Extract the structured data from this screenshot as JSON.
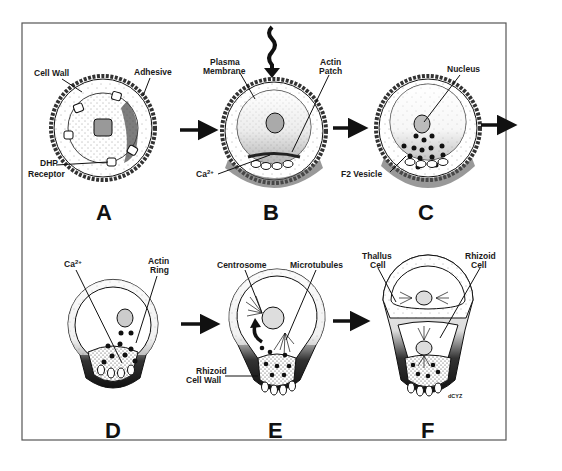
{
  "figure": {
    "panels": [
      {
        "id": "A",
        "letter": "A",
        "labels": {
          "cell_wall": "Cell Wall",
          "adhesive": "Adhesive",
          "dhp_line1": "DHP",
          "dhp_line2": "Receptor"
        }
      },
      {
        "id": "B",
        "letter": "B",
        "labels": {
          "plasma_line1": "Plasma",
          "plasma_line2": "Membrane",
          "actin_line1": "Actin",
          "actin_line2": "Patch",
          "calcium_base": "Ca",
          "calcium_sup": "2+"
        }
      },
      {
        "id": "C",
        "letter": "C",
        "labels": {
          "nucleus": "Nucleus",
          "f2_vesicle": "F2 Vesicle"
        }
      },
      {
        "id": "D",
        "letter": "D",
        "labels": {
          "calcium_base": "Ca",
          "calcium_sup": "2+",
          "actin_line1": "Actin",
          "actin_line2": "Ring"
        }
      },
      {
        "id": "E",
        "letter": "E",
        "labels": {
          "centrosome": "Centrosome",
          "microtubules": "Microtubules",
          "rhizoid_wall_line1": "Rhizoid",
          "rhizoid_wall_line2": "Cell Wall"
        }
      },
      {
        "id": "F",
        "letter": "F",
        "labels": {
          "thallus_line1": "Thallus",
          "thallus_line2": "Cell",
          "rhizoid_line1": "Rhizoid",
          "rhizoid_line2": "Cell",
          "signature": "dCYZ"
        }
      }
    ],
    "arrows": [
      "A-to-B",
      "B-to-C",
      "C-to-next-row",
      "D-to-E",
      "E-to-F"
    ],
    "stimulus": "light-stimulus-arrow",
    "colors": {
      "ink": "#111111",
      "background": "#ffffff",
      "frame": "#555555"
    }
  }
}
